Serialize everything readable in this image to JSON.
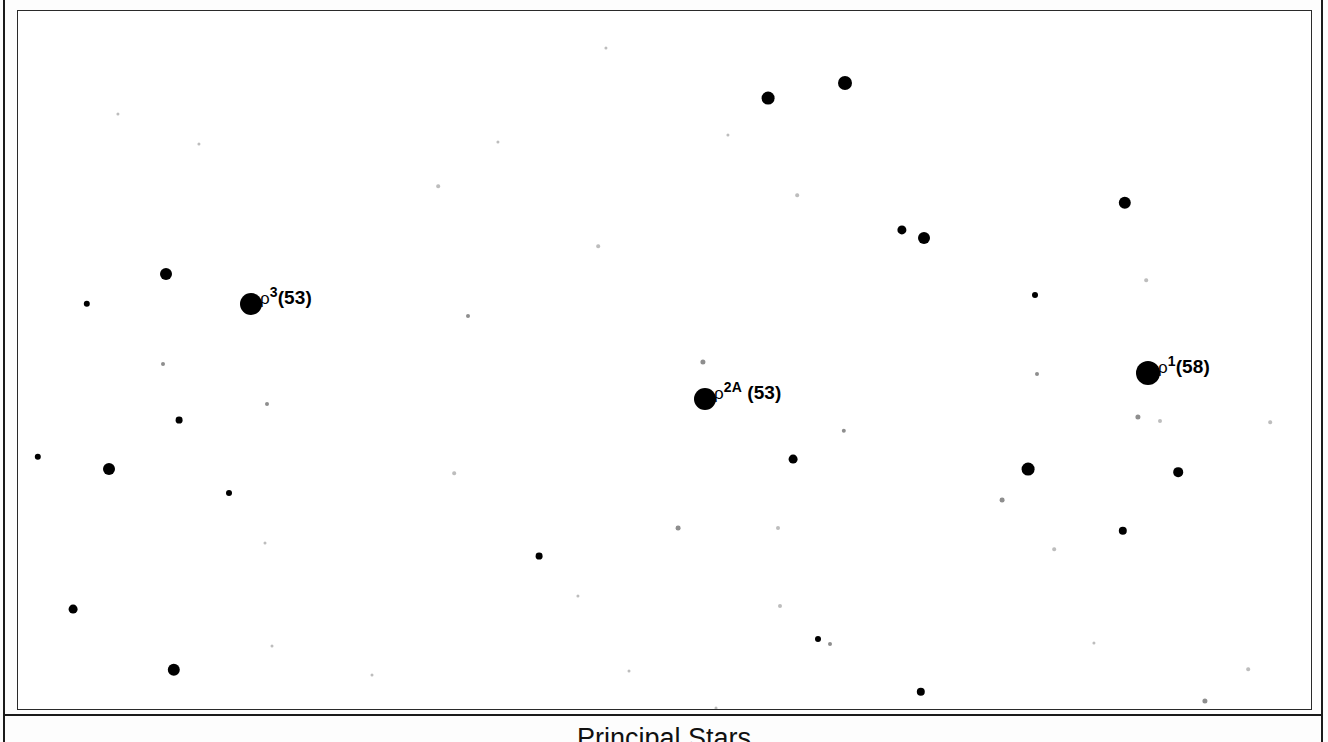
{
  "figure": {
    "caption": "Principal Stars",
    "background_color": "#ffffff",
    "star_color": "#000000",
    "frame_color": "#2a2a2a"
  },
  "chart_data": {
    "type": "scatter",
    "title": "Principal Stars",
    "subtitle": "",
    "xlabel": "",
    "ylabel": "",
    "grid": false,
    "legend": "none",
    "axis_note": "No axes, ticks or tick labels are drawn; positions are plotted in pixel coordinates of the printed chart.",
    "xlim": [
      0,
      1293
    ],
    "ylim": [
      0,
      698
    ],
    "labeled_stars": [
      {
        "id": "rho3",
        "label_rho": "ρ",
        "label_sup": "3",
        "label_tail": "(53)",
        "label_text": "ρ3(53)",
        "x": 233,
        "y": 293,
        "radius": 11,
        "magnitude_rank": "bright"
      },
      {
        "id": "rho2A",
        "label_rho": "ρ",
        "label_sup": "2A",
        "label_tail": " (53)",
        "label_text": "ρ2A (53)",
        "x": 687,
        "y": 388,
        "radius": 11,
        "magnitude_rank": "bright"
      },
      {
        "id": "rho1",
        "label_rho": "ρ",
        "label_sup": "1",
        "label_tail": "(58)",
        "label_text": "ρ1(58)",
        "x": 1130,
        "y": 362,
        "radius": 12,
        "magnitude_rank": "bright"
      }
    ],
    "field_stars": [
      {
        "x": 148,
        "y": 263,
        "radius": 6.0,
        "class": "medium"
      },
      {
        "x": 69,
        "y": 293,
        "radius": 3.2,
        "class": "small"
      },
      {
        "x": 145,
        "y": 353,
        "radius": 2.0,
        "class": "faint"
      },
      {
        "x": 161,
        "y": 409,
        "radius": 3.4,
        "class": "small"
      },
      {
        "x": 20,
        "y": 446,
        "radius": 3.2,
        "class": "small"
      },
      {
        "x": 91,
        "y": 458,
        "radius": 6.0,
        "class": "medium"
      },
      {
        "x": 211,
        "y": 482,
        "radius": 3.0,
        "class": "small"
      },
      {
        "x": 55,
        "y": 598,
        "radius": 4.4,
        "class": "small"
      },
      {
        "x": 156,
        "y": 659,
        "radius": 6.2,
        "class": "medium"
      },
      {
        "x": 249,
        "y": 393,
        "radius": 2.0,
        "class": "faint"
      },
      {
        "x": 100,
        "y": 103,
        "radius": 1.6,
        "class": "vfaint"
      },
      {
        "x": 181,
        "y": 133,
        "radius": 1.6,
        "class": "vfaint"
      },
      {
        "x": 247,
        "y": 532,
        "radius": 1.5,
        "class": "vfaint"
      },
      {
        "x": 254,
        "y": 635,
        "radius": 1.5,
        "class": "vfaint"
      },
      {
        "x": 354,
        "y": 664,
        "radius": 1.5,
        "class": "vfaint"
      },
      {
        "x": 420,
        "y": 175,
        "radius": 1.8,
        "class": "vfaint"
      },
      {
        "x": 450,
        "y": 305,
        "radius": 2.0,
        "class": "faint"
      },
      {
        "x": 436,
        "y": 462,
        "radius": 1.8,
        "class": "vfaint"
      },
      {
        "x": 480,
        "y": 131,
        "radius": 1.6,
        "class": "vfaint"
      },
      {
        "x": 521,
        "y": 545,
        "radius": 3.4,
        "class": "small"
      },
      {
        "x": 560,
        "y": 585,
        "radius": 1.6,
        "class": "vfaint"
      },
      {
        "x": 580,
        "y": 235,
        "radius": 1.8,
        "class": "vfaint"
      },
      {
        "x": 588,
        "y": 37,
        "radius": 1.6,
        "class": "vfaint"
      },
      {
        "x": 611,
        "y": 660,
        "radius": 1.5,
        "class": "vfaint"
      },
      {
        "x": 660,
        "y": 517,
        "radius": 2.4,
        "class": "faint"
      },
      {
        "x": 685,
        "y": 351,
        "radius": 2.6,
        "class": "faint"
      },
      {
        "x": 698,
        "y": 697,
        "radius": 1.5,
        "class": "vfaint"
      },
      {
        "x": 710,
        "y": 124,
        "radius": 1.6,
        "class": "vfaint"
      },
      {
        "x": 750,
        "y": 87,
        "radius": 6.4,
        "class": "medium"
      },
      {
        "x": 760,
        "y": 517,
        "radius": 2.0,
        "class": "vfaint"
      },
      {
        "x": 762,
        "y": 595,
        "radius": 2.0,
        "class": "vfaint"
      },
      {
        "x": 775,
        "y": 448,
        "radius": 4.4,
        "class": "small"
      },
      {
        "x": 779,
        "y": 184,
        "radius": 1.8,
        "class": "vfaint"
      },
      {
        "x": 800,
        "y": 628,
        "radius": 3.0,
        "class": "small"
      },
      {
        "x": 812,
        "y": 633,
        "radius": 2.0,
        "class": "faint"
      },
      {
        "x": 827,
        "y": 72,
        "radius": 7.0,
        "class": "medium"
      },
      {
        "x": 826,
        "y": 420,
        "radius": 2.2,
        "class": "faint"
      },
      {
        "x": 884,
        "y": 219,
        "radius": 4.6,
        "class": "small"
      },
      {
        "x": 903,
        "y": 681,
        "radius": 4.2,
        "class": "small"
      },
      {
        "x": 906,
        "y": 227,
        "radius": 6.0,
        "class": "medium"
      },
      {
        "x": 984,
        "y": 489,
        "radius": 2.4,
        "class": "faint"
      },
      {
        "x": 1010,
        "y": 458,
        "radius": 6.4,
        "class": "medium"
      },
      {
        "x": 1017,
        "y": 284,
        "radius": 3.0,
        "class": "small"
      },
      {
        "x": 1019,
        "y": 363,
        "radius": 2.0,
        "class": "faint"
      },
      {
        "x": 1036,
        "y": 538,
        "radius": 1.8,
        "class": "vfaint"
      },
      {
        "x": 1076,
        "y": 632,
        "radius": 1.6,
        "class": "vfaint"
      },
      {
        "x": 1105,
        "y": 520,
        "radius": 4.2,
        "class": "small"
      },
      {
        "x": 1107,
        "y": 192,
        "radius": 6.2,
        "class": "medium"
      },
      {
        "x": 1120,
        "y": 406,
        "radius": 2.6,
        "class": "faint"
      },
      {
        "x": 1128,
        "y": 269,
        "radius": 1.8,
        "class": "vfaint"
      },
      {
        "x": 1142,
        "y": 410,
        "radius": 2.0,
        "class": "vfaint"
      },
      {
        "x": 1160,
        "y": 461,
        "radius": 4.8,
        "class": "small"
      },
      {
        "x": 1187,
        "y": 690,
        "radius": 2.6,
        "class": "faint"
      },
      {
        "x": 1230,
        "y": 658,
        "radius": 1.8,
        "class": "vfaint"
      },
      {
        "x": 1252,
        "y": 411,
        "radius": 1.8,
        "class": "vfaint"
      },
      {
        "x": 1303,
        "y": 406,
        "radius": 4.6,
        "class": "small"
      }
    ]
  }
}
